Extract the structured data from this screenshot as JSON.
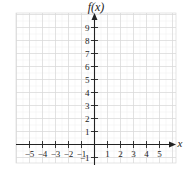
{
  "chart_data": {
    "type": "line",
    "title": "",
    "xlabel": "x",
    "ylabel": "f(x)",
    "xlim": [
      -6,
      6.2
    ],
    "ylim": [
      -1.5,
      10
    ],
    "grid": true,
    "x_ticks": [
      -5,
      -4,
      -3,
      -2,
      -1,
      1,
      2,
      3,
      4,
      5
    ],
    "x_tick_labels": [
      "−5",
      "−4",
      "−3",
      "−2",
      "−1",
      "1",
      "2",
      "3",
      "4",
      "5"
    ],
    "y_ticks": [
      9,
      8,
      7,
      6,
      5,
      4,
      3,
      2,
      1,
      -1
    ],
    "y_tick_labels": [
      "9",
      "8",
      "7",
      "6",
      "5",
      "4",
      "3",
      "2",
      "1",
      "−1"
    ],
    "series": []
  },
  "colors": {
    "axis": "#222222",
    "grid": "#d9d9d9",
    "grid_minor": "#eeeeee"
  }
}
